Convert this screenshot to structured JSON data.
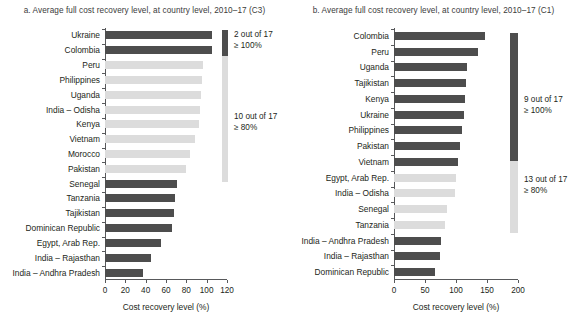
{
  "figure": {
    "background": "#ffffff",
    "colors": {
      "dark_bar": "#4d4d4d",
      "light_bar": "#dcdcdc",
      "axis": "#58595b",
      "text": "#231f20"
    }
  },
  "chart_data": [
    {
      "type": "bar",
      "id": "panel-a",
      "title": "a. Average full cost recovery level, at country level, 2010–17 (C3)",
      "orientation": "horizontal",
      "xlabel": "Cost recovery level (%)",
      "ylabel": "",
      "xlim": [
        0,
        120
      ],
      "xticks": [
        0,
        20,
        40,
        60,
        80,
        100,
        120
      ],
      "xticklabels": [
        "0",
        "20",
        "40",
        "60",
        "80",
        "100",
        "120"
      ],
      "grid": false,
      "legend_position": "right",
      "categories": [
        "Ukraine",
        "Colombia",
        "Peru",
        "Philippines",
        "Uganda",
        "India – Odisha",
        "Kenya",
        "Vietnam",
        "Morocco",
        "Pakistan",
        "Senegal",
        "Tanzania",
        "Tajikistan",
        "Dominican Republic",
        "Egypt, Arab Rep.",
        "India – Rajasthan",
        "India – Andhra Pradesh"
      ],
      "values": [
        105,
        105,
        96,
        95,
        94,
        93,
        92,
        89,
        84,
        80,
        71,
        69,
        68,
        66,
        55,
        45,
        37
      ],
      "bar_shades": [
        "dark",
        "dark",
        "light",
        "light",
        "light",
        "light",
        "light",
        "light",
        "light",
        "light",
        "dark",
        "dark",
        "dark",
        "dark",
        "dark",
        "dark",
        "dark"
      ],
      "annotations": [
        {
          "line1": "2 out of 17",
          "line2": "≥ 100%",
          "shade": "dark"
        },
        {
          "line1": "10 out of 17",
          "line2": "≥ 80%",
          "shade": "light"
        }
      ]
    },
    {
      "type": "bar",
      "id": "panel-b",
      "title": "b. Average full cost recovery level, at country level, 2010–17 (C1)",
      "orientation": "horizontal",
      "xlabel": "Cost recovery level (%)",
      "ylabel": "",
      "xlim": [
        0,
        200
      ],
      "xticks": [
        0,
        50,
        100,
        150,
        200
      ],
      "xticklabels": [
        "0",
        "50",
        "100",
        "150",
        "200"
      ],
      "grid": false,
      "legend_position": "right",
      "categories": [
        "Colombia",
        "Peru",
        "Uganda",
        "Tajikistan",
        "Kenya",
        "Ukraine",
        "Philippines",
        "Pakistan",
        "Vietnam",
        "Egypt, Arab Rep.",
        "India – Odisha",
        "Senegal",
        "Tanzania",
        "India – Andhra Pradesh",
        "India – Rajasthan",
        "Dominican Republic"
      ],
      "values": [
        147,
        135,
        118,
        116,
        114,
        113,
        110,
        106,
        103,
        100,
        98,
        85,
        82,
        76,
        74,
        66
      ],
      "bar_shades": [
        "dark",
        "dark",
        "dark",
        "dark",
        "dark",
        "dark",
        "dark",
        "dark",
        "dark",
        "light",
        "light",
        "light",
        "light",
        "dark",
        "dark",
        "dark"
      ],
      "annotations": [
        {
          "line1": "9 out of 17",
          "line2": "≥ 100%",
          "shade": "dark"
        },
        {
          "line1": "13 out of 17",
          "line2": "≥ 80%",
          "shade": "light"
        }
      ]
    }
  ]
}
